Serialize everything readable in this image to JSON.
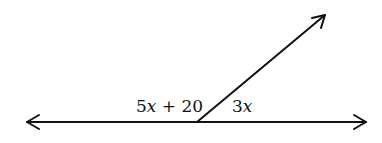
{
  "diagram": {
    "type": "angle-diagram",
    "line": {
      "x1": 27,
      "y1": 122,
      "x2": 366,
      "y2": 122,
      "arrows": "both"
    },
    "ray": {
      "x1": 197,
      "y1": 122,
      "x2": 325,
      "y2": 15,
      "arrow": "end"
    },
    "vertex": {
      "x": 197,
      "y": 122
    },
    "angles": [
      {
        "label": "5x + 20",
        "coef": "5",
        "var": "x",
        "rest": " + 20",
        "position": "left"
      },
      {
        "label": "3x",
        "coef": "3",
        "var": "x",
        "rest": "",
        "position": "right"
      }
    ],
    "stroke_color": "#111111"
  }
}
